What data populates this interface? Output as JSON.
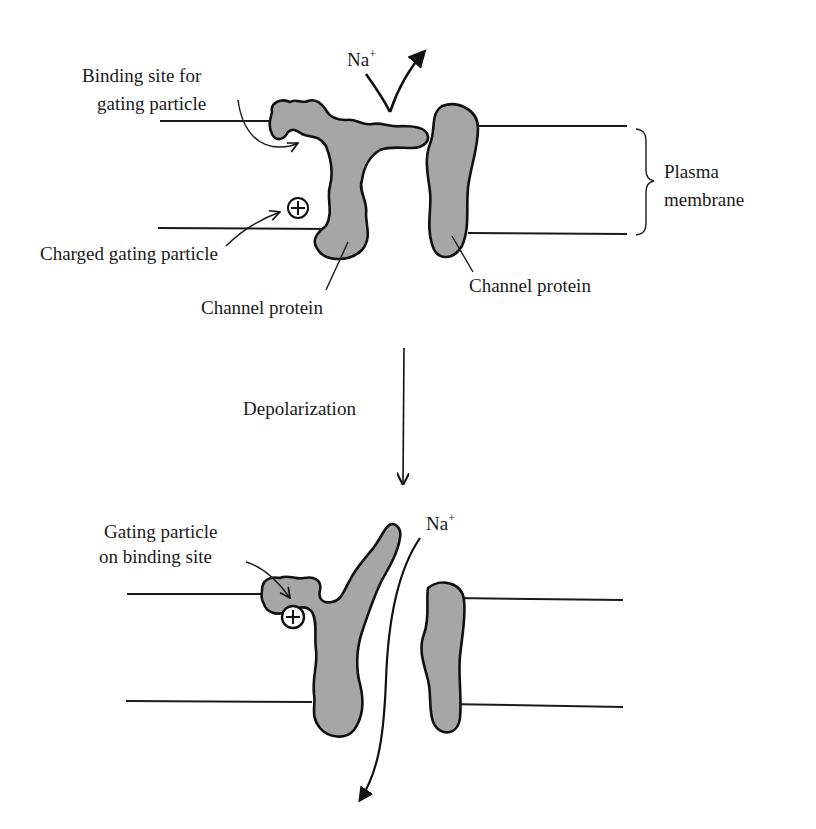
{
  "figure": {
    "top_panel": {
      "state": "closed",
      "labels": {
        "binding_site_line1": "Binding site for",
        "binding_site_line2": "gating particle",
        "ion": "Na",
        "ion_charge": "+",
        "charged_particle": "Charged gating particle",
        "channel_protein_left": "Channel protein",
        "channel_protein_right": "Channel protein",
        "membrane_line1": "Plasma",
        "membrane_line2": "membrane",
        "particle_symbol": "⊕"
      }
    },
    "transition": {
      "label": "Depolarization"
    },
    "bottom_panel": {
      "state": "open",
      "labels": {
        "gating_on_site_line1": "Gating particle",
        "gating_on_site_line2": "on binding site",
        "ion": "Na",
        "ion_charge": "+",
        "particle_symbol": "+"
      }
    },
    "colors": {
      "protein_fill": "#a6a6a6",
      "outline": "#111111",
      "background": "#ffffff"
    }
  }
}
